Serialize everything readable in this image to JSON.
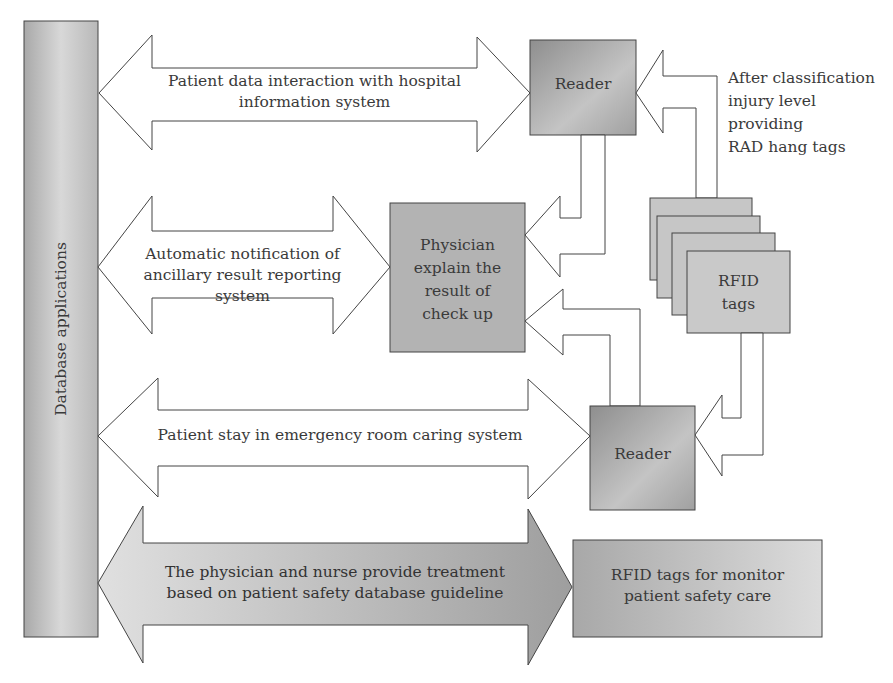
{
  "diagram": {
    "database_column": {
      "label": "Database applications"
    },
    "arrows": [
      {
        "id": "top",
        "label_lines": [
          "Patient data interaction with hospital",
          "information system"
        ]
      },
      {
        "id": "middle",
        "label_lines": [
          "Automatic notification of",
          "ancillary result reporting system"
        ]
      },
      {
        "id": "lower",
        "label_lines": [
          "Patient stay in emergency room caring system"
        ]
      },
      {
        "id": "bottom",
        "label_lines": [
          "The physician and nurse provide treatment",
          "based on patient safety database guideline"
        ]
      }
    ],
    "boxes": {
      "reader_top": {
        "label": "Reader"
      },
      "physician": {
        "label_lines": [
          "Physician",
          "explain the",
          "result of",
          "check up"
        ]
      },
      "rfid_tags": {
        "label_lines": [
          "RFID",
          "tags"
        ]
      },
      "reader_bottom": {
        "label": "Reader"
      },
      "rfid_monitor": {
        "label_lines": [
          "RFID tags for monitor",
          "patient safety care"
        ]
      }
    },
    "annotation": {
      "lines": [
        "After classification",
        "injury level",
        "providing",
        "RAD hang tags"
      ]
    },
    "colors": {
      "stroke": "#444444",
      "box_dark": "#9a9a9a",
      "box_light": "#cfcfcf",
      "fill_white": "#ffffff"
    }
  }
}
